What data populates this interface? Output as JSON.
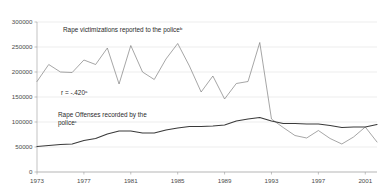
{
  "chart_data": {
    "type": "line",
    "title": "",
    "xlabel": "",
    "ylabel": "",
    "xlim": [
      1973,
      2002
    ],
    "ylim": [
      0,
      300000
    ],
    "grid": true,
    "legend_position": "inline-annotations",
    "y_ticks": [
      "0",
      "50000",
      "100000",
      "150000",
      "200000",
      "250000",
      "300000"
    ],
    "y_tick_values": [
      0,
      50000,
      100000,
      150000,
      200000,
      250000,
      300000
    ],
    "x_ticks": [
      "1973",
      "1977",
      "1981",
      "1985",
      "1989",
      "1993",
      "1997",
      "2001"
    ],
    "x_tick_values": [
      1973,
      1977,
      1981,
      1985,
      1989,
      1993,
      1997,
      2001
    ],
    "x": [
      1973,
      1974,
      1975,
      1976,
      1977,
      1978,
      1979,
      1980,
      1981,
      1982,
      1983,
      1984,
      1985,
      1986,
      1987,
      1988,
      1989,
      1990,
      1991,
      1992,
      1993,
      1994,
      1995,
      1996,
      1997,
      1998,
      1999,
      2000,
      2001,
      2002
    ],
    "series": [
      {
        "name": "Rape victimizations reported to the police",
        "color": "#7f7f7f",
        "width": 0.7,
        "values": [
          181000,
          215000,
          200000,
          199000,
          224000,
          215000,
          248000,
          176000,
          253000,
          200000,
          185000,
          226000,
          257000,
          212000,
          160000,
          192000,
          146000,
          177000,
          181000,
          259000,
          106000,
          89000,
          73000,
          68000,
          83000,
          67000,
          56000,
          70000,
          90000,
          60000
        ]
      },
      {
        "name": "Rape Offenses recorded by the police",
        "color": "#3a3a3a",
        "width": 1.1,
        "values": [
          51000,
          53000,
          55000,
          56000,
          63000,
          67000,
          76000,
          82000,
          82000,
          78000,
          78000,
          84000,
          88000,
          91000,
          91000,
          92000,
          94000,
          102000,
          106000,
          109000,
          102000,
          97000,
          97000,
          96000,
          96000,
          93000,
          89000,
          90000,
          90000,
          95000
        ]
      }
    ],
    "annotations": [
      {
        "name": "correlation",
        "text": "r = -.420",
        "superscript": "a",
        "x": 61,
        "y": 95
      }
    ],
    "series_labels": [
      {
        "name": "upper-series-label",
        "lines": [
          "Rape victimizations reported to the police"
        ],
        "superscript": "b",
        "x": 63,
        "y": 32
      },
      {
        "name": "lower-series-label",
        "lines": [
          "Rape Offenses recorded by the",
          "police"
        ],
        "superscript": "c",
        "x": 58,
        "y": 117
      }
    ]
  }
}
